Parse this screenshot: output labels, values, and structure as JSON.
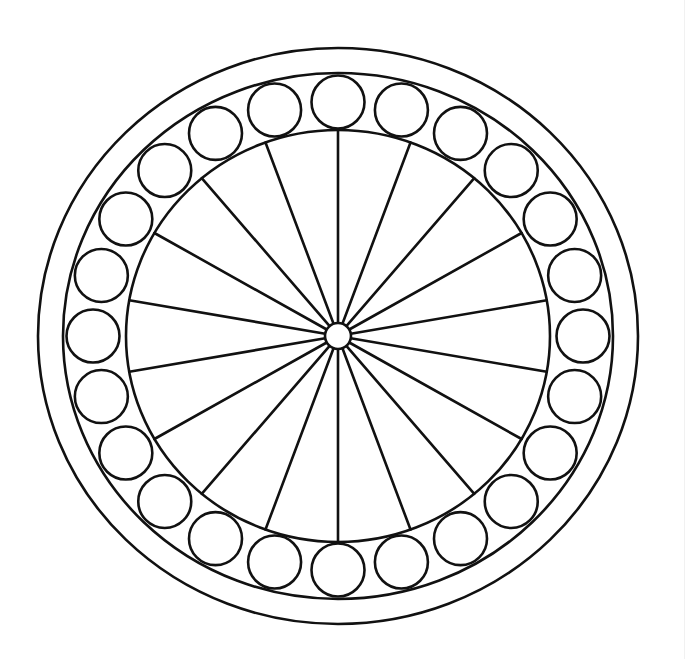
{
  "title": "Wheel with spokes and ring of circles",
  "colors": {
    "background": "#ffffff",
    "stroke": "#111111",
    "edge_line": "#f1f1f1"
  },
  "diagram": {
    "type": "line-art-wheel",
    "center": {
      "x": 338,
      "y": 336
    },
    "stroke_width": 2.6,
    "rings": [
      {
        "name": "outer-rim",
        "rx": 300,
        "ry": 288
      },
      {
        "name": "bead-track-outer",
        "rx": 275,
        "ry": 263
      },
      {
        "name": "inner-rim",
        "rx": 212,
        "ry": 206
      }
    ],
    "hub": {
      "r": 13
    },
    "spokes": {
      "count": 18,
      "start_angle_deg": -90
    },
    "beads": {
      "count": 24,
      "orbit_rx": 245,
      "orbit_ry": 234,
      "r": 26.5,
      "start_angle_deg": -90
    }
  }
}
